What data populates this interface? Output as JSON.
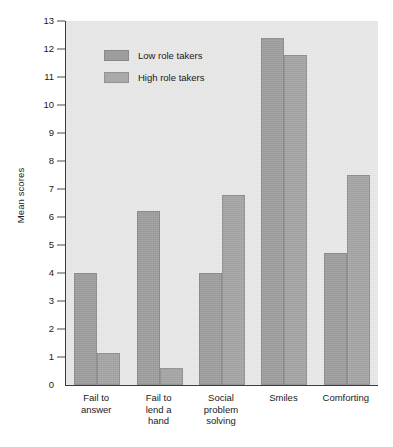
{
  "chart_data": {
    "type": "bar",
    "title": "",
    "xlabel": "",
    "ylabel": "Mean scores",
    "ylim": [
      0,
      13
    ],
    "yticks": [
      0,
      1,
      2,
      3,
      4,
      5,
      6,
      7,
      8,
      9,
      10,
      11,
      12,
      13
    ],
    "ytick_labels": [
      "0",
      "1",
      "2",
      "3",
      "4",
      "5",
      "6",
      "7",
      "8",
      "9",
      "10",
      "11",
      "12",
      "13"
    ],
    "grid": false,
    "legend_position": "upper left inside",
    "categories": [
      "Fail to\nanswer",
      "Fail to\nlend a\nhand",
      "Social\nproblem\nsolving",
      "Smiles",
      "Comforting"
    ],
    "category_lines": [
      [
        "Fail to",
        "answer"
      ],
      [
        "Fail to",
        "lend a",
        "hand"
      ],
      [
        "Social",
        "problem",
        "solving"
      ],
      [
        "Smiles"
      ],
      [
        "Comforting"
      ]
    ],
    "series": [
      {
        "name": "Low role takers",
        "color": "#9d9d9d",
        "values": [
          4.0,
          6.2,
          4.0,
          12.4,
          4.7
        ]
      },
      {
        "name": "High role takers",
        "color": "#a4a4a4",
        "values": [
          1.15,
          0.6,
          6.8,
          11.8,
          7.5
        ]
      }
    ]
  },
  "axis": {
    "y_title": "Mean scores"
  },
  "legend": {
    "entries": [
      {
        "label": "Low role takers"
      },
      {
        "label": "High role takers"
      }
    ]
  },
  "colors": {
    "plot_background": "#e8e8e8",
    "axis_line": "#3c3c3c",
    "bar_low": "#9d9d9d",
    "bar_high": "#a4a4a4",
    "text": "#1a1a1a"
  }
}
